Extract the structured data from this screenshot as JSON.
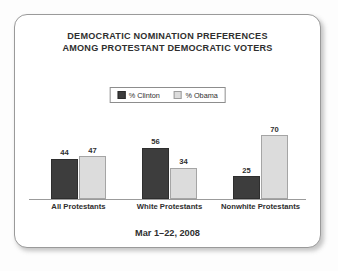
{
  "card": {
    "border_color": "#9a9a9a",
    "background": "#ffffff"
  },
  "title": {
    "line1": "DEMOCRATIC NOMINATION PREFERENCES",
    "line2": "AMONG PROTESTANT DEMOCRATIC VOTERS"
  },
  "legend": {
    "items": [
      {
        "label": "% Clinton",
        "color": "#3d3d3d",
        "swatch": "clinton-swatch-icon"
      },
      {
        "label": "% Obama",
        "color": "#dcdcdc",
        "swatch": "obama-swatch-icon"
      }
    ]
  },
  "footer": {
    "date_range": "Mar 1–22, 2008"
  },
  "chart_data": {
    "type": "bar",
    "title": "DEMOCRATIC NOMINATION PREFERENCES AMONG PROTESTANT DEMOCRATIC VOTERS",
    "subtitle": "Mar 1–22, 2008",
    "categories": [
      "All Protestants",
      "White Protestants",
      "Nonwhite Protestants"
    ],
    "series": [
      {
        "name": "% Clinton",
        "color": "#3d3d3d",
        "values": [
          44,
          56,
          25
        ]
      },
      {
        "name": "% Obama",
        "color": "#dcdcdc",
        "values": [
          47,
          34,
          70
        ]
      }
    ],
    "xlabel": "",
    "ylabel": "",
    "ylim": [
      0,
      80
    ],
    "grid": false,
    "legend_position": "top-center",
    "value_labels": true,
    "axis_line": true
  }
}
